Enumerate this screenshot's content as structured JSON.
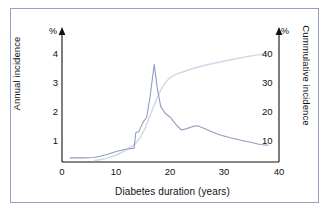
{
  "figure": {
    "border_color": "#93a0c4",
    "background": "#ffffff"
  },
  "axes": {
    "left": {
      "title": "Annual incidence",
      "unit": "%",
      "ticks": [
        1,
        2,
        3,
        4
      ],
      "range": [
        0,
        4.6
      ]
    },
    "right": {
      "title": "Cummulative incidence",
      "unit": "%",
      "ticks": [
        10,
        20,
        30,
        40
      ],
      "range": [
        0,
        46
      ]
    },
    "x": {
      "title": "Diabetes duration (years)",
      "ticks": [
        0,
        10,
        20,
        30,
        40
      ],
      "range": [
        0,
        40
      ]
    }
  },
  "chart_data": {
    "type": "line",
    "title": "",
    "xlabel": "Diabetes duration (years)",
    "ylabel": "Annual incidence",
    "y2label": "Cummulative incidence",
    "xlim": [
      0,
      40
    ],
    "ylim": [
      0,
      4.6
    ],
    "y2lim": [
      0,
      46
    ],
    "xticks": [
      0,
      10,
      20,
      30,
      40
    ],
    "yticks": [
      1,
      2,
      3,
      4
    ],
    "y2ticks": [
      10,
      20,
      30,
      40
    ],
    "grid": false,
    "legend": "none",
    "series": [
      {
        "name": "Annual incidence",
        "axis": "left",
        "color": "#8f9dc4",
        "unit": "%",
        "x": [
          1.5,
          4,
          6,
          8,
          10,
          11.5,
          12.2,
          13.3,
          13.6,
          14.2,
          15,
          15.6,
          16.2,
          17,
          17.6,
          18.2,
          19,
          20,
          21,
          22,
          23,
          24,
          25,
          26,
          27.5,
          29,
          31,
          33,
          35,
          36.5,
          38
        ],
        "y": [
          0.15,
          0.15,
          0.16,
          0.25,
          0.38,
          0.45,
          0.47,
          0.5,
          1.05,
          1.1,
          1.45,
          1.6,
          2.3,
          3.5,
          2.6,
          2.0,
          1.75,
          1.6,
          1.35,
          1.15,
          1.2,
          1.27,
          1.3,
          1.22,
          1.1,
          0.98,
          0.87,
          0.78,
          0.7,
          0.63,
          0.6
        ]
      },
      {
        "name": "Cummulative incidence",
        "axis": "right",
        "color": "#d4d9ea",
        "unit": "%",
        "x": [
          6,
          8,
          10,
          12,
          13.5,
          14.5,
          15.5,
          16.5,
          17.5,
          18.5,
          19.5,
          20,
          21,
          22.5,
          24,
          26,
          28,
          30,
          32,
          34,
          36,
          38
        ],
        "y": [
          0.5,
          1.2,
          2.5,
          4.5,
          6.5,
          9.0,
          13.0,
          18.0,
          23.0,
          27.0,
          29.5,
          30.5,
          31.5,
          32.5,
          33.5,
          34.6,
          35.5,
          36.3,
          37.1,
          37.8,
          38.5,
          39.0
        ]
      }
    ]
  }
}
